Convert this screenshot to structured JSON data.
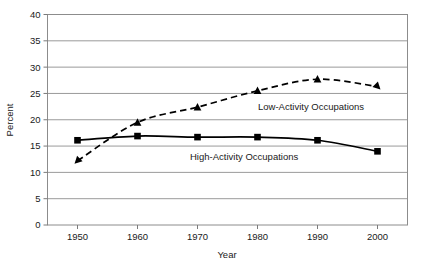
{
  "chart_data": {
    "type": "line",
    "title": "",
    "xlabel": "Year",
    "ylabel": "Percent",
    "x": [
      1950,
      1960,
      1970,
      1980,
      1990,
      2000
    ],
    "xtick_labels": [
      "1950",
      "1960",
      "1970",
      "1980",
      "1990",
      "2000"
    ],
    "ytick_labels": [
      "0",
      "5",
      "10",
      "15",
      "20",
      "25",
      "30",
      "35",
      "40"
    ],
    "ytick_values": [
      0,
      5,
      10,
      15,
      20,
      25,
      30,
      35,
      40
    ],
    "xlim": [
      1945,
      2005
    ],
    "ylim": [
      0,
      40
    ],
    "grid": "horizontal",
    "legend_position": "inline-annotation",
    "series": [
      {
        "name": "Low-Activity Occupations",
        "values": [
          12.2,
          19.5,
          22.4,
          25.5,
          27.7,
          26.3
        ],
        "marker": "triangle",
        "line_style": "dashed",
        "color": "#000000",
        "annotation_label": "Low-Activity Occupations"
      },
      {
        "name": "High-Activity Occupations",
        "values": [
          16.1,
          16.9,
          16.7,
          16.7,
          16.1,
          14.0
        ],
        "marker": "square",
        "line_style": "solid",
        "color": "#000000",
        "annotation_label": "High-Activity Occupations"
      }
    ]
  },
  "axes": {
    "y_axis_title": "Percent",
    "x_axis_title": "Year"
  },
  "annotations": {
    "low_activity": "Low-Activity Occupations",
    "high_activity": "High-Activity Occupations"
  },
  "colors": {
    "series_ink": "#000000",
    "gridline": "#9a9a9a",
    "frame": "#7a7a7a",
    "background": "#ffffff",
    "text": "#1a1a1a"
  }
}
